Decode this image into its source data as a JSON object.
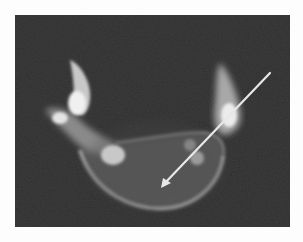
{
  "image": {
    "kind": "CT axial slice of vertebra",
    "background_color": "#2e2e2e",
    "page_color": "#fdfdfd",
    "annotation": {
      "type": "arrow",
      "color": "#e8e8e8",
      "from": [
        270,
        73
      ],
      "to": [
        162,
        187
      ]
    }
  }
}
